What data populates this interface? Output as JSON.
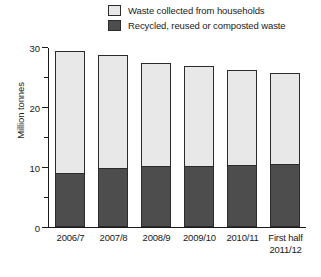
{
  "chart_data": {
    "type": "bar",
    "title": "",
    "xlabel": "",
    "ylabel": "Million tonnes",
    "ylim": [
      0,
      30
    ],
    "ytick_labels": [
      "0",
      "10",
      "20",
      "30"
    ],
    "ytick_values": [
      0,
      10,
      20,
      30
    ],
    "yminor_ticks": [
      5,
      15,
      25
    ],
    "grid": false,
    "stacked": true,
    "legend_position": "top-right",
    "categories": [
      "2006/7",
      "2007/8",
      "2008/9",
      "2009/10",
      "2010/11",
      "First half 2011/12"
    ],
    "category_lines": [
      [
        "2006/7"
      ],
      [
        "2007/8"
      ],
      [
        "2008/9"
      ],
      [
        "2009/10"
      ],
      [
        "2010/11"
      ],
      [
        "First half",
        "2011/12"
      ]
    ],
    "series": [
      {
        "name": "Waste collected from households",
        "color": "#e8e8e8",
        "values": [
          20.3,
          18.8,
          17.2,
          16.6,
          15.7,
          15.1
        ]
      },
      {
        "name": "Recycled, reused or composted waste",
        "color": "#4d4d4d",
        "values": [
          9.0,
          9.8,
          10.1,
          10.2,
          10.4,
          10.5
        ]
      }
    ],
    "totals": [
      29.3,
      28.6,
      27.3,
      26.8,
      26.1,
      25.6
    ]
  },
  "legend": {
    "items": [
      {
        "label": "Waste collected from households",
        "swatch": "light-swatch-icon"
      },
      {
        "label": "Recycled, reused or composted waste",
        "swatch": "dark-swatch-icon"
      }
    ]
  },
  "axis": {
    "y_title": "Million tonnes"
  }
}
